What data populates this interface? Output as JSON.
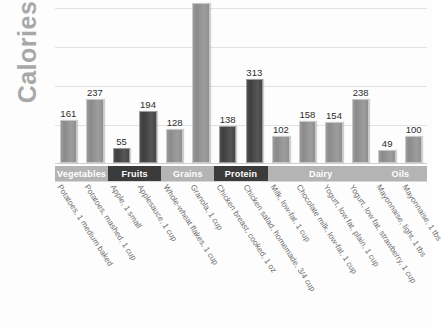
{
  "chart_data": {
    "type": "bar",
    "title": "",
    "xlabel": "",
    "ylabel": "Calories",
    "orientation": "vertical",
    "grid": true,
    "legend": false,
    "ylim": [
      0,
      610
    ],
    "gridline_step": 145,
    "note_clipped_bar": "Granola, 1 cup bar extends above the top edge of the image; its value label is not visible",
    "categories": [
      "Potatoes, 1 medium baked",
      "Potatoes, mashed, 1 cup",
      "Apple, 1 small",
      "Applesauce, 1 cup",
      "Whole-wheat flakes, 1 cup",
      "Granola, 1 cup",
      "Chicken breast, cooked, 1 oz",
      "Chicken salad, homemade, 3/4 cup",
      "Milk, low-fat, 1 cup",
      "Chocolate milk, low-fat, 1 cup",
      "Yogurt, low fat, plain, 1 cup",
      "Yogurt, low fat, strawberry, 1 cup",
      "Mayonnaise, light, 1 tbs",
      "Mayonnaise, 1 tbs"
    ],
    "values": [
      161,
      237,
      55,
      194,
      128,
      597,
      138,
      313,
      102,
      158,
      154,
      238,
      49,
      100
    ],
    "value_labels": [
      "161",
      "237",
      "55",
      "194",
      "128",
      "",
      "138",
      "313",
      "102",
      "158",
      "154",
      "238",
      "49",
      "100"
    ],
    "groups": [
      {
        "label": "Vegetables",
        "shade": "light",
        "bar_indices": [
          0,
          1
        ]
      },
      {
        "label": "Fruits",
        "shade": "dark",
        "bar_indices": [
          2,
          3
        ]
      },
      {
        "label": "Grains",
        "shade": "light",
        "bar_indices": [
          4,
          5
        ]
      },
      {
        "label": "Protein",
        "shade": "dark",
        "bar_indices": [
          6,
          7
        ]
      },
      {
        "label": "Dairy",
        "shade": "light",
        "bar_indices": [
          8,
          9,
          10,
          11
        ]
      },
      {
        "label": "Oils",
        "shade": "light",
        "bar_indices": [
          12,
          13
        ]
      }
    ]
  },
  "colors": {
    "bar_light": "#939393",
    "bar_dark": "#474747",
    "band_light": "#b4b4b4",
    "band_dark": "#3b3b3b",
    "gridline": "#e2e2e2",
    "axis_title": "#a8a8a8",
    "value_text": "#2c2c2c",
    "item_label_text": "#6e6e6e",
    "background": "#fdfdfd"
  }
}
